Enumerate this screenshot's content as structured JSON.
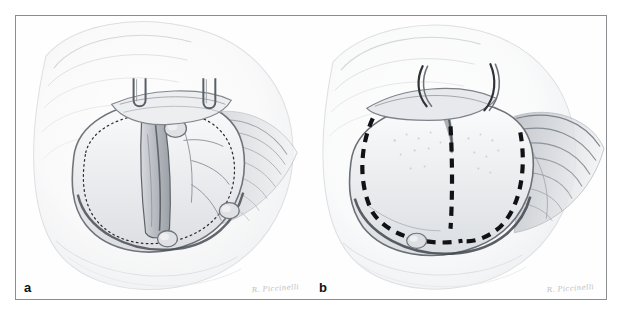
{
  "figure": {
    "type": "medical-illustration",
    "medium": "pencil drawing",
    "panel_count": 2,
    "frame_color": "#8b8d90",
    "background_color": "#ffffff",
    "paper_tone": "#fdfdfd",
    "ink_color": "#1a1a1a",
    "shading_color": "#9aa0a6"
  },
  "panels": [
    {
      "id": "a",
      "label": "a",
      "signature": "R. Piccinelli",
      "description": "Operative view with fine dotted incision outline marking the planned capsular opening; two retractor hooks elevate a tissue band at the top; small nodular structures sit along the inferior and medial margin.",
      "annotations": {
        "outline_style": "fine dotted",
        "outline_name": "planned-incision-outline",
        "hook_count": 2,
        "nodule_count": 3,
        "vessel_branch_count": 3
      }
    },
    {
      "id": "b",
      "label": "b",
      "signature": "R. Piccinelli",
      "description": "Operative view after exposure showing bold dashed resection lines outlining a U-shaped region with a central vertical dividing line; two curved retractor hooks at the superior margin; muscle striations fan out to the right.",
      "annotations": {
        "outline_style": "bold dashed",
        "outline_name": "resection-margin-lines",
        "hook_count": 2,
        "dashed_segment_count": 3,
        "nodule_count": 1
      }
    }
  ]
}
